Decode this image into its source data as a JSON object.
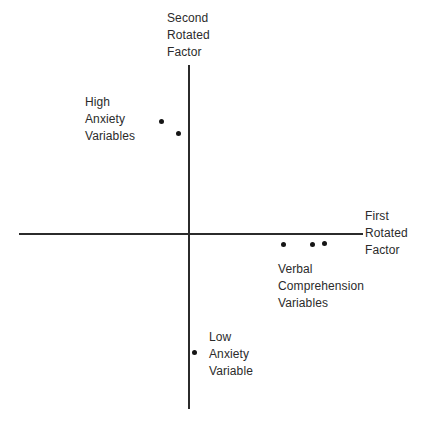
{
  "figure": {
    "background_color": "#ffffff",
    "ink_color": "#2b2b2b",
    "point_color": "#151515"
  },
  "axes": {
    "vertical": {
      "label_lines": [
        "Second",
        "Rotated",
        "Factor"
      ],
      "label_text": "Second Rotated Factor"
    },
    "horizontal": {
      "label_lines": [
        "First",
        "Rotated",
        "Factor"
      ],
      "label_text": "First Rotated Factor"
    }
  },
  "annotations": [
    {
      "id": "high-anxiety",
      "lines": [
        "High",
        "Anxiety",
        "Variables"
      ],
      "text": "High Anxiety Variables"
    },
    {
      "id": "verbal-comprehension",
      "lines": [
        "Verbal",
        "Comprehension",
        "Variables"
      ],
      "text": "Verbal Comprehension Variables"
    },
    {
      "id": "low-anxiety",
      "lines": [
        "Low",
        "Anxiety",
        "Variable"
      ],
      "text": "Low Anxiety Variable"
    }
  ],
  "chart_data": {
    "type": "scatter",
    "title": "",
    "xlabel": "First Rotated Factor",
    "ylabel": "Second Rotated Factor",
    "xlim": [
      -1.0,
      1.0
    ],
    "ylim": [
      -1.0,
      1.0
    ],
    "grid": false,
    "legend": false,
    "axis_origin_px": [
      188,
      234
    ],
    "series": [
      {
        "name": "High Anxiety Variables",
        "group": "high-anxiety",
        "points": [
          {
            "x": -0.16,
            "y": 0.66,
            "px": 161,
            "py": 121
          },
          {
            "x": -0.06,
            "y": 0.59,
            "px": 178,
            "py": 133
          }
        ]
      },
      {
        "name": "Verbal Comprehension Variables",
        "group": "verbal-comprehension",
        "points": [
          {
            "x": 0.55,
            "y": -0.06,
            "px": 283,
            "py": 244
          },
          {
            "x": 0.72,
            "y": -0.06,
            "px": 312,
            "py": 244
          },
          {
            "x": 0.79,
            "y": -0.05,
            "px": 324,
            "py": 243
          }
        ]
      },
      {
        "name": "Low Anxiety Variable",
        "group": "low-anxiety",
        "points": [
          {
            "x": 0.03,
            "y": -0.69,
            "px": 194,
            "py": 352
          }
        ]
      }
    ]
  }
}
